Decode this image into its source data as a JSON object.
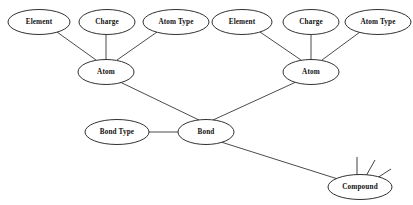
{
  "diagram": {
    "background_color": "#ffffff",
    "line_color": "#2b2b2b",
    "node_fill": "#ffffff",
    "node_stroke": "#1a1a1a",
    "label_color": "#111111",
    "nodes": [
      {
        "id": "element-left",
        "label": "Element",
        "cx": 39,
        "cy": 22,
        "rx": 31,
        "ry": 12.5
      },
      {
        "id": "charge-left",
        "label": "Charge",
        "cx": 107,
        "cy": 22,
        "rx": 28,
        "ry": 12.5
      },
      {
        "id": "atomtype-left",
        "label": "Atom Type",
        "cx": 176,
        "cy": 22,
        "rx": 33,
        "ry": 12.5
      },
      {
        "id": "element-right",
        "label": "Element",
        "cx": 242,
        "cy": 22,
        "rx": 30,
        "ry": 12.5
      },
      {
        "id": "charge-right",
        "label": "Charge",
        "cx": 311,
        "cy": 22,
        "rx": 28,
        "ry": 12.5
      },
      {
        "id": "atomtype-right",
        "label": "Atom Type",
        "cx": 378,
        "cy": 22,
        "rx": 33,
        "ry": 12.5
      },
      {
        "id": "atom-left",
        "label": "Atom",
        "cx": 106,
        "cy": 72,
        "rx": 28,
        "ry": 12.5
      },
      {
        "id": "atom-right",
        "label": "Atom",
        "cx": 311,
        "cy": 72,
        "rx": 28,
        "ry": 12.5
      },
      {
        "id": "bondtype",
        "label": "Bond Type",
        "cx": 117,
        "cy": 132,
        "rx": 32,
        "ry": 12.5
      },
      {
        "id": "bond",
        "label": "Bond",
        "cx": 206,
        "cy": 132,
        "rx": 28,
        "ry": 12.5
      },
      {
        "id": "compound",
        "label": "Compound",
        "cx": 360,
        "cy": 187,
        "rx": 32,
        "ry": 12.5
      }
    ],
    "edges": [
      {
        "id": "element-left-to-atom-left",
        "from": "element-left",
        "to": "atom-left",
        "x1": 57,
        "y1": 32,
        "x2": 96,
        "y2": 60
      },
      {
        "id": "charge-left-to-atom-left",
        "from": "charge-left",
        "to": "atom-left",
        "x1": 106,
        "y1": 35,
        "x2": 106,
        "y2": 60
      },
      {
        "id": "atomtype-left-to-atom-left",
        "from": "atomtype-left",
        "to": "atom-left",
        "x1": 157,
        "y1": 32,
        "x2": 117,
        "y2": 60
      },
      {
        "id": "element-right-to-atom-right",
        "from": "element-right",
        "to": "atom-right",
        "x1": 260,
        "y1": 32,
        "x2": 301,
        "y2": 60
      },
      {
        "id": "charge-right-to-atom-right",
        "from": "charge-right",
        "to": "atom-right",
        "x1": 311,
        "y1": 35,
        "x2": 311,
        "y2": 60
      },
      {
        "id": "atomtype-right-to-atom-right",
        "from": "atomtype-right",
        "to": "atom-right",
        "x1": 360,
        "y1": 32,
        "x2": 322,
        "y2": 60
      },
      {
        "id": "atom-left-to-bond",
        "from": "atom-left",
        "to": "bond",
        "x1": 120,
        "y1": 82,
        "x2": 199,
        "y2": 120
      },
      {
        "id": "atom-right-to-bond",
        "from": "atom-right",
        "to": "bond",
        "x1": 296,
        "y1": 82,
        "x2": 213,
        "y2": 120
      },
      {
        "id": "bondtype-to-bond",
        "from": "bondtype",
        "to": "bond",
        "x1": 149,
        "y1": 132,
        "x2": 178,
        "y2": 132
      },
      {
        "id": "bond-to-compound",
        "from": "bond",
        "to": "compound",
        "x1": 221,
        "y1": 142,
        "x2": 341,
        "y2": 180
      }
    ],
    "compound_sparks": [
      {
        "id": "spark-1",
        "x1": 357,
        "y1": 175,
        "x2": 357,
        "y2": 157
      },
      {
        "id": "spark-2",
        "x1": 366,
        "y1": 176,
        "x2": 375,
        "y2": 160
      },
      {
        "id": "spark-3",
        "x1": 374,
        "y1": 180,
        "x2": 391,
        "y2": 169
      }
    ]
  }
}
